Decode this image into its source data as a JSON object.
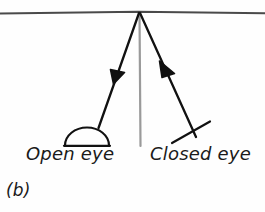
{
  "figure": {
    "caption": "(b)",
    "background_color": "#fefefe",
    "ink_color": "#1a1a1a",
    "guide_color": "#8c8c8c",
    "width": 265,
    "height": 212
  },
  "labels": {
    "open_eye": "Open eye",
    "closed_eye": "Closed eye"
  },
  "diagram_elements": {
    "surface_line": "horizontal-surface-line",
    "normal_line": "vertical-normal-line",
    "outgoing_ray": "ray-to-open-eye",
    "incoming_ray": "ray-from-closed-eye",
    "open_eye_symbol": "semicircle-dome",
    "closed_eye_symbol": "cross-x-mark"
  }
}
